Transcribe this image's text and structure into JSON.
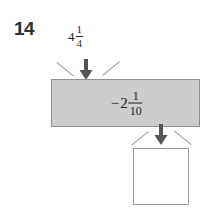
{
  "problem": {
    "number": "14"
  },
  "input": {
    "whole": "4",
    "numerator": "1",
    "denominator": "4",
    "full_text": "4 1/4"
  },
  "operation": {
    "sign": "−",
    "whole": "2",
    "numerator": "1",
    "denominator": "10",
    "full_text": "−2 1/10"
  },
  "answer": {
    "value": "",
    "placeholder": ""
  },
  "icons": {
    "input_arrow": "arrow-down-icon",
    "output_arrow": "arrow-down-icon"
  },
  "colors": {
    "machine_fill": "#cdcdcd",
    "machine_border": "#8e8e8e",
    "arrow": "#555555",
    "box_border": "#9a9a9a",
    "text": "#1f1f1f",
    "number_text": "#2e2e2e"
  }
}
